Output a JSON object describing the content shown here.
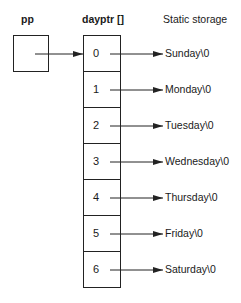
{
  "headers": {
    "pointer": "pp",
    "array": "dayptr []",
    "storage": "Static storage"
  },
  "array_cells": [
    {
      "index": "0",
      "string": "Sunday\\0"
    },
    {
      "index": "1",
      "string": "Monday\\0"
    },
    {
      "index": "2",
      "string": "Tuesday\\0"
    },
    {
      "index": "3",
      "string": "Wednesday\\0"
    },
    {
      "index": "4",
      "string": "Thursday\\0"
    },
    {
      "index": "5",
      "string": "Friday\\0"
    },
    {
      "index": "6",
      "string": "Saturday\\0"
    }
  ],
  "colors": {
    "line": "#222222",
    "background": "#ffffff"
  }
}
